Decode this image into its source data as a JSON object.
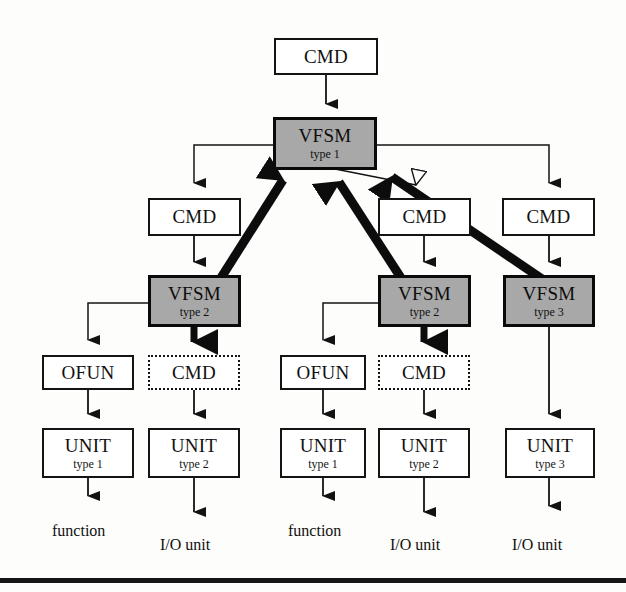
{
  "diagram": {
    "colors": {
      "shaded_fill": "#a8a8a8",
      "plain_fill": "#ffffff",
      "stroke": "#141414",
      "hollow_arrow_fill": "#ffffff"
    },
    "nodes": [
      {
        "id": "cmd_top",
        "label": "CMD",
        "sub": "",
        "style": "plain",
        "x": 274,
        "y": 38,
        "w": 104,
        "h": 37
      },
      {
        "id": "vfsm1",
        "label": "VFSM",
        "sub": "type 1",
        "style": "shaded",
        "x": 273,
        "y": 117,
        "w": 104,
        "h": 53
      },
      {
        "id": "cmd_l",
        "label": "CMD",
        "sub": "",
        "style": "plain",
        "x": 148,
        "y": 198,
        "w": 93,
        "h": 38
      },
      {
        "id": "cmd_m",
        "label": "CMD",
        "sub": "",
        "style": "plain",
        "x": 378,
        "y": 198,
        "w": 93,
        "h": 38
      },
      {
        "id": "cmd_r",
        "label": "CMD",
        "sub": "",
        "style": "plain",
        "x": 502,
        "y": 198,
        "w": 93,
        "h": 38
      },
      {
        "id": "vfsm2_l",
        "label": "VFSM",
        "sub": "type 2",
        "style": "shaded",
        "x": 148,
        "y": 275,
        "w": 93,
        "h": 52
      },
      {
        "id": "vfsm2_m",
        "label": "VFSM",
        "sub": "type 2",
        "style": "shaded",
        "x": 378,
        "y": 275,
        "w": 93,
        "h": 52
      },
      {
        "id": "vfsm3_r",
        "label": "VFSM",
        "sub": "type 3",
        "style": "shaded",
        "x": 503,
        "y": 275,
        "w": 92,
        "h": 52
      },
      {
        "id": "ofun_l",
        "label": "OFUN",
        "sub": "",
        "style": "plain",
        "x": 42,
        "y": 355,
        "w": 92,
        "h": 35
      },
      {
        "id": "cmd_d_l",
        "label": "CMD",
        "sub": "",
        "style": "dashed",
        "x": 148,
        "y": 355,
        "w": 92,
        "h": 35
      },
      {
        "id": "ofun_m",
        "label": "OFUN",
        "sub": "",
        "style": "plain",
        "x": 280,
        "y": 355,
        "w": 86,
        "h": 35
      },
      {
        "id": "cmd_d_m",
        "label": "CMD",
        "sub": "",
        "style": "dashed",
        "x": 378,
        "y": 355,
        "w": 92,
        "h": 35
      },
      {
        "id": "unit1",
        "label": "UNIT",
        "sub": "type 1",
        "style": "plain",
        "x": 42,
        "y": 428,
        "w": 92,
        "h": 50
      },
      {
        "id": "unit2",
        "label": "UNIT",
        "sub": "type 2",
        "style": "plain",
        "x": 148,
        "y": 428,
        "w": 92,
        "h": 50
      },
      {
        "id": "unit3",
        "label": "UNIT",
        "sub": "type 1",
        "style": "plain",
        "x": 280,
        "y": 428,
        "w": 86,
        "h": 50
      },
      {
        "id": "unit4",
        "label": "UNIT",
        "sub": "type 2",
        "style": "plain",
        "x": 378,
        "y": 428,
        "w": 92,
        "h": 50
      },
      {
        "id": "unit5",
        "label": "UNIT",
        "sub": "type 3",
        "style": "plain",
        "x": 505,
        "y": 428,
        "w": 90,
        "h": 50
      }
    ],
    "captions": [
      {
        "id": "cap_function_l",
        "text": "function",
        "x": 52,
        "y": 522
      },
      {
        "id": "cap_io_l",
        "text": "I/O unit",
        "x": 160,
        "y": 536
      },
      {
        "id": "cap_function_m",
        "text": "function",
        "x": 288,
        "y": 522
      },
      {
        "id": "cap_io_m",
        "text": "I/O unit",
        "x": 390,
        "y": 536
      },
      {
        "id": "cap_io_r",
        "text": "I/O unit",
        "x": 512,
        "y": 536
      }
    ],
    "edges": [
      {
        "id": "e_cmdtop_vfsm1",
        "kind": "thin-down",
        "from": "cmd_top",
        "to": "vfsm1"
      },
      {
        "id": "e_vfsm1_cmdl",
        "kind": "thin-bus",
        "from": "vfsm1",
        "to": "cmd_l"
      },
      {
        "id": "e_vfsm1_cmdm",
        "kind": "hollow",
        "from": "vfsm1",
        "to": "cmd_m"
      },
      {
        "id": "e_vfsm1_cmdr",
        "kind": "thin-bus",
        "from": "vfsm1",
        "to": "cmd_r"
      },
      {
        "id": "e_cmdl_vfsm2l",
        "kind": "thin-down",
        "from": "cmd_l",
        "to": "vfsm2_l"
      },
      {
        "id": "e_cmdm_vfsm2m",
        "kind": "thin-down",
        "from": "cmd_m",
        "to": "vfsm2_m"
      },
      {
        "id": "e_cmdr_vfsm3r",
        "kind": "thin-down",
        "from": "cmd_r",
        "to": "vfsm3_r"
      },
      {
        "id": "e_vfsm2l_vfsm1",
        "kind": "thick-up",
        "from": "vfsm2_l",
        "to": "vfsm1"
      },
      {
        "id": "e_vfsm2m_vfsm1",
        "kind": "thick-up",
        "from": "vfsm2_m",
        "to": "vfsm1"
      },
      {
        "id": "e_vfsm3r_vfsm1",
        "kind": "thick-up",
        "from": "vfsm3_r",
        "to": "vfsm1"
      },
      {
        "id": "e_vfsm2l_ofunl",
        "kind": "thin-elbow",
        "from": "vfsm2_l",
        "to": "ofun_l"
      },
      {
        "id": "e_vfsm2l_cmdl",
        "kind": "thick-down",
        "from": "vfsm2_l",
        "to": "cmd_d_l"
      },
      {
        "id": "e_vfsm2m_ofunm",
        "kind": "thin-elbow",
        "from": "vfsm2_m",
        "to": "ofun_m"
      },
      {
        "id": "e_vfsm2m_cmdm",
        "kind": "thick-down",
        "from": "vfsm2_m",
        "to": "cmd_d_m"
      },
      {
        "id": "e_vfsm3r_unit5",
        "kind": "thin-long",
        "from": "vfsm3_r",
        "to": "unit5"
      },
      {
        "id": "e_ofunl_unit1",
        "kind": "thin-down",
        "from": "ofun_l",
        "to": "unit1"
      },
      {
        "id": "e_cmddl_unit2",
        "kind": "thin-down",
        "from": "cmd_d_l",
        "to": "unit2"
      },
      {
        "id": "e_ofunm_unit3",
        "kind": "thin-down",
        "from": "ofun_m",
        "to": "unit3"
      },
      {
        "id": "e_cmddm_unit4",
        "kind": "thin-down",
        "from": "cmd_d_m",
        "to": "unit4"
      },
      {
        "id": "e_unit1_func",
        "kind": "thin-down",
        "from": "unit1",
        "to": "cap_function_l"
      },
      {
        "id": "e_unit2_io",
        "kind": "thin-down",
        "from": "unit2",
        "to": "cap_io_l"
      },
      {
        "id": "e_unit3_func",
        "kind": "thin-down",
        "from": "unit3",
        "to": "cap_function_m"
      },
      {
        "id": "e_unit4_io",
        "kind": "thin-down",
        "from": "unit4",
        "to": "cap_io_m"
      },
      {
        "id": "e_unit5_io",
        "kind": "thin-down",
        "from": "unit5",
        "to": "cap_io_r"
      }
    ],
    "footer_rule": {
      "y": 578,
      "height": 5
    }
  }
}
